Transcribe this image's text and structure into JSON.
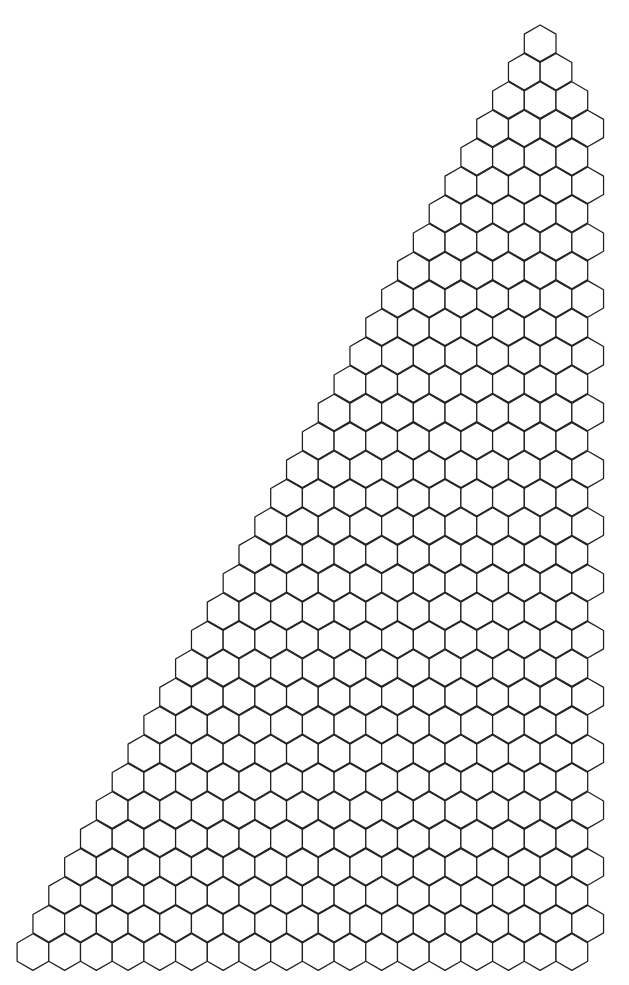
{
  "figure": {
    "type": "hexagonal-grid",
    "shape": "right-triangle staircase",
    "orientation": "pointy-top",
    "background": "#ffffff",
    "stroke_color": "#1e1e1e",
    "rows": 33,
    "hex_width": 31.7,
    "hex_height": 36.6,
    "row_pitch": 28.4,
    "top_row_left_x": 524.3,
    "top_row_top_y": 25,
    "row_left_step": 15.85,
    "right_boundary_even_rows": 589,
    "right_boundary_odd_rows": 605,
    "hex_counts_per_row": [
      1,
      2,
      3,
      4,
      4,
      5,
      5,
      6,
      6,
      7,
      7,
      8,
      8,
      9,
      9,
      10,
      10,
      11,
      11,
      12,
      12,
      13,
      13,
      14,
      14,
      15,
      15,
      16,
      16,
      17,
      17,
      18,
      18
    ]
  }
}
